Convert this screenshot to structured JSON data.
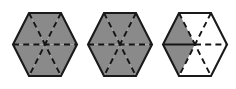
{
  "figure": {
    "canvas_width": 236,
    "canvas_height": 89,
    "background_color": "#ffffff",
    "shaded_color": "#8a8a8a",
    "unshaded_color": "#ffffff",
    "outline_color": "#1a1a1a",
    "dash_color": "#141414",
    "sector_count_per_hexagon": 6,
    "hexagons": [
      {
        "id": "hexagon-1",
        "label": "Hexagon 1",
        "center_x": 45,
        "center_y": 44.5,
        "radius_x": 32,
        "radius_y": 31.5,
        "shaded_sectors": [
          0,
          1,
          2,
          3,
          4,
          5
        ],
        "shaded_count": 6,
        "fraction": "6/6",
        "divider_styles": [
          "dashed",
          "dashed",
          "dashed"
        ]
      },
      {
        "id": "hexagon-2",
        "label": "Hexagon 2",
        "center_x": 120,
        "center_y": 44.5,
        "radius_x": 32,
        "radius_y": 31.5,
        "shaded_sectors": [
          0,
          1,
          2,
          3,
          4,
          5
        ],
        "shaded_count": 6,
        "fraction": "6/6",
        "divider_styles": [
          "dashed",
          "dashed",
          "dashed"
        ]
      },
      {
        "id": "hexagon-3",
        "label": "Hexagon 3",
        "center_x": 195,
        "center_y": 44.5,
        "radius_x": 32,
        "radius_y": 31.5,
        "shaded_sectors": [
          2,
          3
        ],
        "shaded_count": 2,
        "fraction": "2/6",
        "divider_styles": [
          "solid-left-dashed-right",
          "dashed",
          "dashed"
        ]
      }
    ]
  }
}
